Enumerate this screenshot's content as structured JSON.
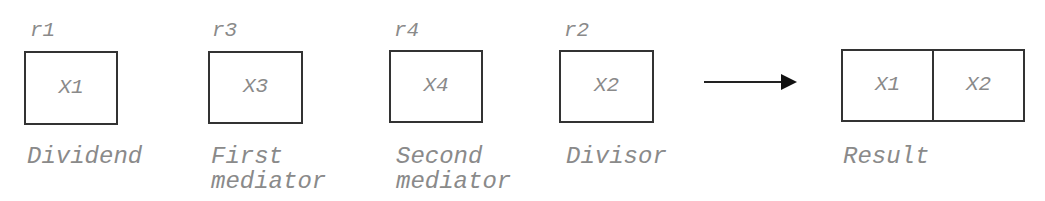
{
  "diagram": {
    "registers": [
      {
        "register": "r1",
        "value": "X1",
        "caption": "Dividend"
      },
      {
        "register": "r3",
        "value": "X3",
        "caption": "First\nmediator"
      },
      {
        "register": "r4",
        "value": "X4",
        "caption": "Second\nmediator"
      },
      {
        "register": "r2",
        "value": "X2",
        "caption": "Divisor"
      }
    ],
    "arrow": "right-arrow",
    "result": {
      "cells": [
        "X1",
        "X2"
      ],
      "caption": "Result"
    },
    "colors": {
      "stroke": "#333333",
      "text": "#8a8a8a",
      "background": "#ffffff"
    }
  }
}
